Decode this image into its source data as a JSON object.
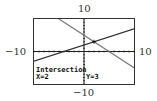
{
  "chart_data": {
    "type": "line",
    "title": "",
    "xlim": [
      -10,
      10
    ],
    "ylim": [
      -10,
      10
    ],
    "tick_labels": {
      "ymax": "10",
      "ymin": "−10",
      "xmin": "−10",
      "xmax": "10"
    },
    "xscl": 1,
    "yscl": 1,
    "series": [
      {
        "name": "y1",
        "equation": "y = -x + 5",
        "slope": -1,
        "intercept": 5
      },
      {
        "name": "y2",
        "equation": "y = 0.5x + 2",
        "slope": 0.5,
        "intercept": 2
      }
    ],
    "annotations": {
      "label": "Intersection",
      "x_readout": "X=2",
      "y_readout": "Y=3",
      "point": [
        2,
        3
      ]
    }
  }
}
